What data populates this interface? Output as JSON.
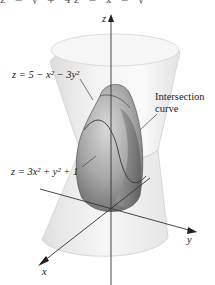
{
  "figure": {
    "top_cut_text": "z = y + 4z = x = y",
    "axes": {
      "z_label": "z",
      "y_label": "y",
      "x_label": "x"
    },
    "labels": {
      "upper_surface": "z = 5 − x² − 3y²",
      "lower_surface": "z = 3x² + y² + 1",
      "intersection_line1": "Intersection",
      "intersection_line2": "curve"
    },
    "colors": {
      "background": "#ffffff",
      "outer_surface": "#ececec",
      "outer_edge": "#d6d6d6",
      "inner_cap_light": "#c8c8c8",
      "inner_cap_dark": "#7a7a7a",
      "axis": "#333333",
      "leader": "#444444"
    }
  }
}
